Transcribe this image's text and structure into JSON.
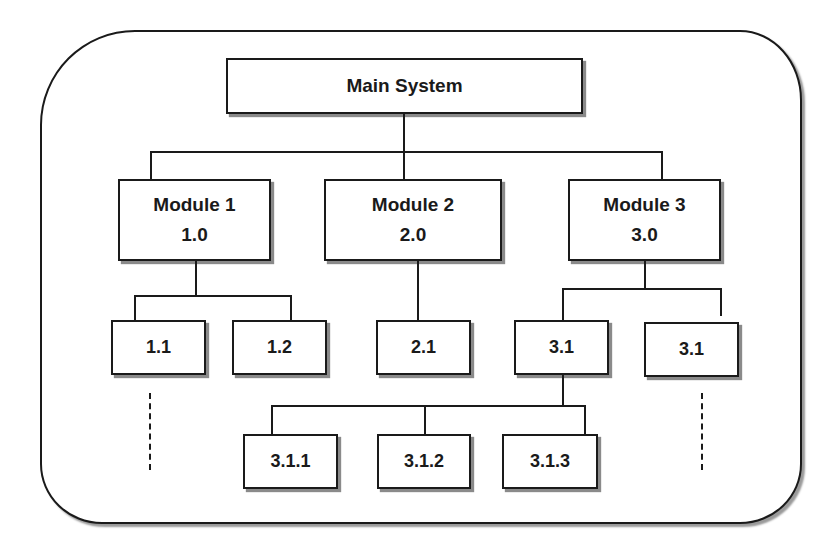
{
  "diagram": {
    "type": "hierarchy",
    "root": {
      "label": "Main System"
    },
    "modules": [
      {
        "name": "Module 1",
        "code": "1.0",
        "children": [
          "1.1",
          "1.2"
        ],
        "continues": true
      },
      {
        "name": "Module 2",
        "code": "2.0",
        "children": [
          "2.1"
        ]
      },
      {
        "name": "Module 3",
        "code": "3.0",
        "children": [
          "3.1",
          "3.1"
        ],
        "continues": true
      }
    ],
    "subsub": {
      "parent": "3.1",
      "children": [
        "3.1.1",
        "3.1.2",
        "3.1.3"
      ]
    }
  },
  "colors": {
    "stroke": "#1a1a1a",
    "shadow": "#8a8a8a",
    "background": "#ffffff"
  }
}
